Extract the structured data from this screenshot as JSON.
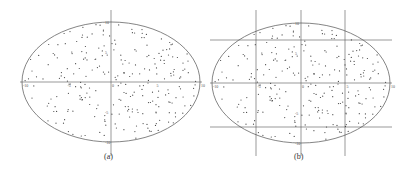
{
  "figure": {
    "panels": [
      {
        "id": "a",
        "caption": "(a)",
        "center": [
          111,
          82
        ],
        "rx": 89,
        "ry": 60,
        "grid": "axes only",
        "vlines": [
          111
        ],
        "hlines": [
          82
        ],
        "tick_labels": {
          "x": [
            "-10",
            "-5",
            "0",
            "5",
            "10"
          ],
          "y": [
            "10",
            "5",
            "0",
            "-5",
            "-10"
          ]
        }
      },
      {
        "id": "b",
        "caption": "(b)",
        "center": [
          301,
          83
        ],
        "rx": 89,
        "ry": 60,
        "grid": "3x3 partition with axes",
        "vlines": [
          256,
          301,
          345
        ],
        "hlines": [
          40,
          83,
          127
        ],
        "tick_labels": {
          "x": [
            "-10",
            "-5",
            "0",
            "5",
            "10"
          ],
          "y": [
            "10",
            "5",
            "0",
            "-5",
            "-10"
          ]
        }
      }
    ]
  },
  "chart_data": [
    {
      "type": "scatter",
      "title": "(a)",
      "description": "Random points uniformly scattered inside an ellipse, with x and y axes through the center",
      "xlim": [
        -10,
        10
      ],
      "ylim": [
        -10,
        10
      ],
      "x_ticks": [
        -10,
        -5,
        0,
        5,
        10
      ],
      "y_ticks": [
        -10,
        -5,
        0,
        5,
        10
      ],
      "grid": false,
      "point_count_approx": 250
    },
    {
      "type": "scatter",
      "title": "(b)",
      "description": "Same scattered points in an ellipse, partitioned by grid lines at x=-5,0,5 and y=-5,0,5",
      "xlim": [
        -10,
        10
      ],
      "ylim": [
        -10,
        10
      ],
      "x_ticks": [
        -10,
        -5,
        0,
        5,
        10
      ],
      "y_ticks": [
        -10,
        -5,
        0,
        5,
        10
      ],
      "grid_lines": {
        "x": [
          -5,
          0,
          5
        ],
        "y": [
          -5,
          0,
          5
        ]
      },
      "point_count_approx": 250
    }
  ]
}
